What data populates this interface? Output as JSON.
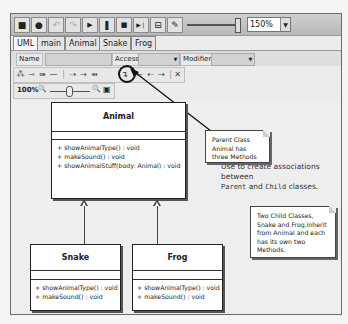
{
  "toolbar": {
    "buttons": [
      {
        "icon": "save-icon",
        "glyph": "■"
      },
      {
        "icon": "print-icon",
        "glyph": "●"
      },
      {
        "icon": "undo-icon",
        "glyph": "↶"
      },
      {
        "icon": "redo-icon",
        "glyph": "↷"
      },
      {
        "icon": "play-icon",
        "glyph": "▶"
      },
      {
        "icon": "pause-icon",
        "glyph": "❚"
      },
      {
        "icon": "stop-icon",
        "glyph": "■"
      },
      {
        "icon": "step-icon",
        "glyph": "▶❘"
      },
      {
        "icon": "export-icon",
        "glyph": "⊟"
      },
      {
        "icon": "pen-icon",
        "glyph": "✎"
      }
    ],
    "zoom_value": "150%",
    "zoom_arrow": "▼"
  },
  "tabs": [
    {
      "label": "UML",
      "active": true
    },
    {
      "label": "main",
      "active": false
    },
    {
      "label": "Animal",
      "active": false
    },
    {
      "label": "Snake",
      "active": false
    },
    {
      "label": "Frog",
      "active": false
    }
  ],
  "properties": {
    "name_label": "Name",
    "name_value": "",
    "access_label": "Access",
    "access_value": "",
    "modifier_label": "Modifier",
    "modifier_value": "",
    "arrow": "▼"
  },
  "uml_tools": [
    {
      "icon": "class-tool-icon",
      "glyph": "⁂"
    },
    {
      "icon": "association-icon",
      "glyph": "⇾"
    },
    {
      "icon": "aggregation-icon",
      "glyph": "⇛"
    },
    {
      "icon": "line-icon",
      "glyph": "—"
    },
    {
      "icon": "separator",
      "glyph": "|"
    },
    {
      "icon": "dependency-icon",
      "glyph": "⇢"
    },
    {
      "icon": "directed-icon",
      "glyph": "→"
    },
    {
      "icon": "composition-icon",
      "glyph": "⇴"
    },
    {
      "icon": "generalization-icon",
      "glyph": "↴"
    },
    {
      "icon": "back-arrow-icon",
      "glyph": "←"
    },
    {
      "icon": "realization-icon",
      "glyph": "⇠"
    },
    {
      "icon": "forward-arrow-icon",
      "glyph": "→"
    },
    {
      "icon": "separator2",
      "glyph": "|"
    },
    {
      "icon": "delete-icon",
      "glyph": "✕"
    }
  ],
  "zoom_bar": {
    "label": "100%",
    "zoom_out_glyph": "🔍",
    "zoom_in_glyph": "🔍",
    "fit_glyph": "▣"
  },
  "callout": {
    "line1": "Use to create associations between",
    "parent": "Parent",
    "and": " and ",
    "child": "Child",
    "tail": " classes."
  },
  "classes": {
    "animal": {
      "name": "Animal",
      "ops": [
        "+ showAnimalType() : void",
        "+ makeSound() : void",
        "+ showAnimalStuff(body: Animal) : void"
      ]
    },
    "snake": {
      "name": "Snake",
      "ops": [
        "+ showAnimalType() : void",
        "+ makeSound() : void"
      ]
    },
    "frog": {
      "name": "Frog",
      "ops": [
        "+ showAnimalType() : void",
        "+ makeSound() : void"
      ]
    }
  },
  "notes": {
    "parent_note": "Parent Class Animal has three Methods",
    "child_note": "Two Child Classes, Snake and Frog,inherit from Animal and each has its own two Methods."
  }
}
